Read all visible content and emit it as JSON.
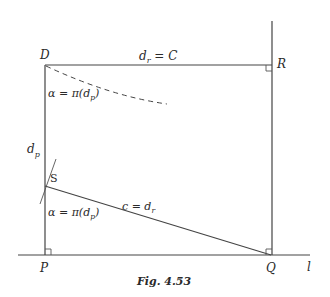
{
  "figure": {
    "caption": "Fig. 4.53",
    "points": {
      "D": "D",
      "R": "R",
      "P": "P",
      "Q": "Q",
      "S": "S"
    },
    "line_label": "l",
    "labels": {
      "top_segment": "d_r = C",
      "top_segment_main": "d",
      "top_segment_sub": "r",
      "top_segment_rest": " = C",
      "angle_top": "α = π(d_p)",
      "angle_top_main": "α = π(d",
      "angle_top_sub": "p",
      "angle_top_close": ")",
      "left_segment": "d_p",
      "left_segment_main": "d",
      "left_segment_sub": "p",
      "hyp_segment": "c = d_r",
      "hyp_segment_main": "c = d",
      "hyp_segment_sub": "r",
      "angle_bottom": "α = π(d_p)",
      "angle_bottom_main": "α = π(d",
      "angle_bottom_sub": "p",
      "angle_bottom_close": ")"
    }
  }
}
